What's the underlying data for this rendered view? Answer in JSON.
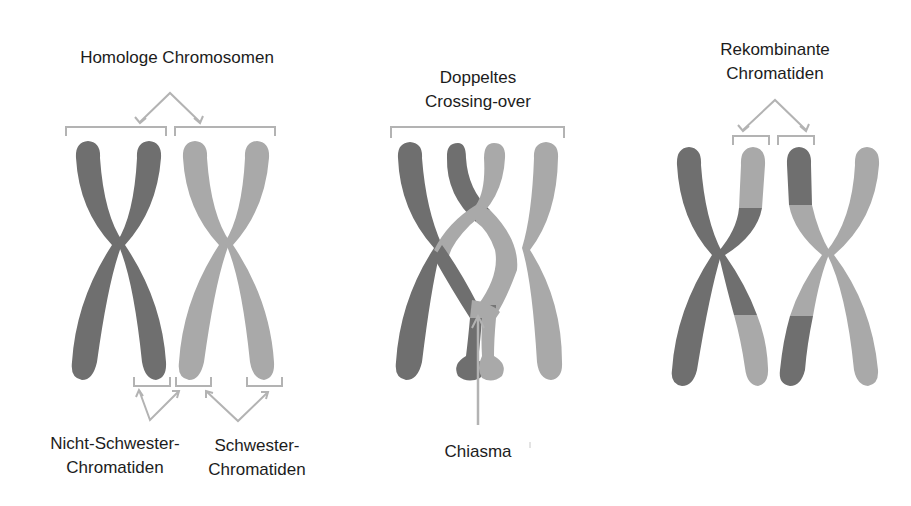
{
  "colors": {
    "dark_chromatid": "#6f6f6f",
    "light_chromatid": "#a9a9a9",
    "bracket": "#b3b3b3",
    "text": "#1c1c1c",
    "background": "#ffffff"
  },
  "panels": [
    {
      "id": "homologous",
      "title": "Homologe Chromosomen",
      "bottom_labels": [
        {
          "line1": "Nicht-Schwester-",
          "line2": "Chromatiden"
        },
        {
          "line1": "Schwester-",
          "line2": "Chromatiden"
        }
      ]
    },
    {
      "id": "double-crossover",
      "title_line1": "Doppeltes",
      "title_line2": "Crossing-over",
      "bottom_label": "Chiasma"
    },
    {
      "id": "recombinant",
      "title_line1": "Rekombinante",
      "title_line2": "Chromatiden"
    }
  ]
}
